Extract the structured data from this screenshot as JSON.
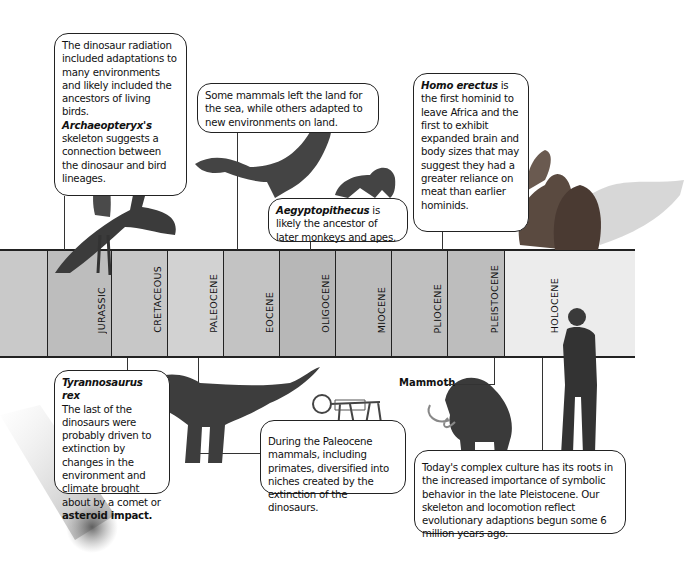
{
  "timeline": {
    "periods": [
      {
        "label": "",
        "color": "#c9c9c9"
      },
      {
        "label": "JURASSIC",
        "color": "#bdbdbd"
      },
      {
        "label": "CRETACEOUS",
        "color": "#c7c7c7"
      },
      {
        "label": "PALEOCENE",
        "color": "#d2d2d2"
      },
      {
        "label": "EOCENE",
        "color": "#c3c3c3"
      },
      {
        "label": "OLIGOCENE",
        "color": "#b7b7b7"
      },
      {
        "label": "MIOCENE",
        "color": "#bcbcbc"
      },
      {
        "label": "PLIOCENE",
        "color": "#bfbfbf"
      },
      {
        "label": "PLEISTOCENE",
        "color": "#bdbdbd"
      },
      {
        "label": "HOLOCENE",
        "color": "#ececec"
      }
    ]
  },
  "callouts": {
    "dinosaur_radiation": {
      "text_before": "The dinosaur radiation included adaptations to many environments and likely included the ancestors of living birds. ",
      "emphasis": "Archaeopteryx's",
      "text_after": " skeleton suggests a connection between the dinosaur and bird lineages."
    },
    "mammals_sea": {
      "text": "Some mammals left the land for the sea, while others adapted to new environments on land."
    },
    "aegyptopithecus": {
      "emphasis": "Aegyptopithecus",
      "text_after": " is likely the ancestor of later monkeys and apes."
    },
    "homo_erectus": {
      "emphasis": "Homo erectus",
      "text_after": " is the first hominid to leave Africa and the first to exhibit expanded brain and body sizes that may suggest they had a greater reliance on meat than earlier hominids."
    },
    "t_rex": {
      "title": "Tyrannosaurus rex",
      "text_before": "The last of the dinosaurs were probably driven to extinction by changes in the environment and climate brought about by a comet or ",
      "emphasis": "asteroid impact.",
      "text_after": ""
    },
    "paleocene": {
      "text": "During the Paleocene mammals, including primates, diversified into niches created by the extinction of the dinosaurs."
    },
    "today": {
      "text": "Today's complex culture has its roots in the increased importance of symbolic behavior in the late Pleistocene. Our skeleton and locomotion reflect evolutionary adaptions begun some 6 million years ago."
    }
  },
  "labels": {
    "mammoth": "Mammoth"
  },
  "illustrations": {
    "archaeopteryx": "archaeopteryx-illustration",
    "whale": "whale-illustration",
    "monkey": "aegyptopithecus-illustration",
    "hominids": "homo-erectus-illustration",
    "t_rex": "tyrannosaurus-illustration",
    "skeleton": "primate-skeleton-illustration",
    "mammoth": "mammoth-illustration",
    "modern_human": "modern-human-illustration",
    "comet": "comet-illustration"
  }
}
